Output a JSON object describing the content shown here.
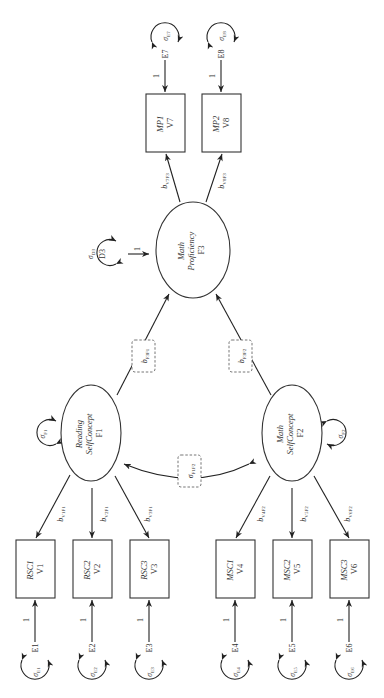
{
  "diagram": {
    "type": "structural-equation-model-path-diagram",
    "orientation": "rotated-90-ccw",
    "factors": [
      {
        "id": "F1",
        "name_line1": "Reading",
        "name_line2": "SelfConcept",
        "code": "F1",
        "disturbance_variance": "σ",
        "disturbance_sub": "F1"
      },
      {
        "id": "F2",
        "name_line1": "Math",
        "name_line2": "SelfConcept",
        "code": "F2",
        "disturbance_variance": "σ",
        "disturbance_sub": "F2"
      },
      {
        "id": "F3",
        "name_line1": "Math",
        "name_line2": "Proficiency",
        "code": "F3"
      }
    ],
    "disturbance_F3": {
      "code": "D3",
      "variance": "σ",
      "variance_sub": "D3",
      "path_label": "1"
    },
    "indicators": [
      {
        "name": "RSC1",
        "code": "V1",
        "error": "E1",
        "error_var": "σ",
        "error_var_sub": "E1",
        "path_label": "1",
        "loading": "b",
        "loading_sub": "V1F1"
      },
      {
        "name": "RSC2",
        "code": "V2",
        "error": "E2",
        "error_var": "σ",
        "error_var_sub": "E2",
        "path_label": "1",
        "loading": "b",
        "loading_sub": "V2F1"
      },
      {
        "name": "RSC3",
        "code": "V3",
        "error": "E3",
        "error_var": "σ",
        "error_var_sub": "E3",
        "path_label": "1",
        "loading": "b",
        "loading_sub": "V3F1"
      },
      {
        "name": "MSC1",
        "code": "V4",
        "error": "E4",
        "error_var": "σ",
        "error_var_sub": "E4",
        "path_label": "1",
        "loading": "b",
        "loading_sub": "V4F2"
      },
      {
        "name": "MSC2",
        "code": "V5",
        "error": "E5",
        "error_var": "σ",
        "error_var_sub": "E5",
        "path_label": "1",
        "loading": "b",
        "loading_sub": "V5F2"
      },
      {
        "name": "MSC3",
        "code": "V6",
        "error": "E6",
        "error_var": "σ",
        "error_var_sub": "E6",
        "path_label": "1",
        "loading": "b",
        "loading_sub": "V6F2"
      },
      {
        "name": "MP1",
        "code": "V7",
        "error": "E7",
        "error_var": "σ",
        "error_var_sub": "E7",
        "path_label": "1",
        "loading": "b",
        "loading_sub": "V7F3"
      },
      {
        "name": "MP2",
        "code": "V8",
        "error": "E8",
        "error_var": "σ",
        "error_var_sub": "E8",
        "path_label": "1",
        "loading": "b",
        "loading_sub": "V8F3"
      }
    ],
    "structural_paths": [
      {
        "from": "F1",
        "to": "F3",
        "label": "b",
        "label_sub": "F3F1"
      },
      {
        "from": "F2",
        "to": "F3",
        "label": "b",
        "label_sub": "F3F2"
      }
    ],
    "covariance": {
      "between": [
        "F1",
        "F2"
      ],
      "label": "σ",
      "label_sub": "F1F2"
    }
  }
}
